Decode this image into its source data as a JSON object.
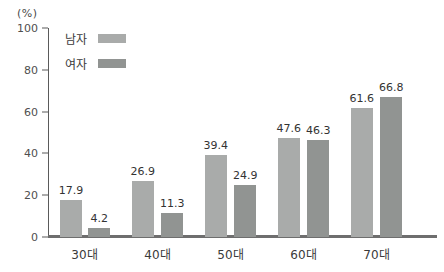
{
  "chart_data": {
    "type": "bar",
    "title": "",
    "unit_label": "(%)",
    "categories": [
      "30대",
      "40대",
      "50대",
      "60대",
      "70대"
    ],
    "series": [
      {
        "name": "남자",
        "color": "#a9abaa",
        "values": [
          17.9,
          26.9,
          39.4,
          47.6,
          61.6
        ]
      },
      {
        "name": "여자",
        "color": "#919492",
        "values": [
          4.2,
          11.3,
          24.9,
          46.3,
          66.8
        ]
      }
    ],
    "ylim": [
      0,
      100
    ],
    "yticks": [
      0,
      20,
      40,
      60,
      80,
      100
    ],
    "grid": false,
    "legend_position": "top-left-inside",
    "axis_color": "#5a5a5a",
    "baseline_color": "#6e6e6e"
  }
}
